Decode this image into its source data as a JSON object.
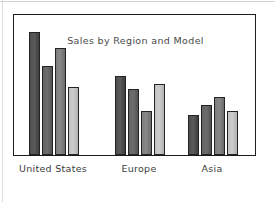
{
  "chart_data": {
    "type": "bar",
    "title": "Sales by Region and Model",
    "xlabel": "",
    "ylabel": "",
    "categories": [
      "United States",
      "Europe",
      "Asia"
    ],
    "series": [
      {
        "name": "Model 1",
        "color": "#545454",
        "values": [
          61,
          39,
          20
        ]
      },
      {
        "name": "Model 2",
        "color": "#686868",
        "values": [
          44,
          33,
          25
        ]
      },
      {
        "name": "Model 3",
        "color": "#828282",
        "values": [
          53,
          22,
          29
        ]
      },
      {
        "name": "Model 4",
        "color": "#c8c8c8",
        "values": [
          34,
          35,
          22
        ]
      }
    ],
    "ylim": [
      0,
      70
    ],
    "grid": false,
    "legend": "none",
    "style": "hand-drawn sketch"
  },
  "frame": {
    "border_color": "#1c1c1c"
  }
}
